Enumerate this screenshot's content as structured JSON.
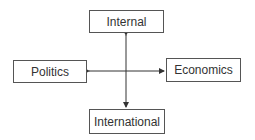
{
  "diagram": {
    "type": "cross-axes",
    "nodes": {
      "top": {
        "label": "Internal"
      },
      "left": {
        "label": "Politics"
      },
      "right": {
        "label": "Economics"
      },
      "bottom": {
        "label": "International"
      }
    },
    "edges": [
      {
        "from": "top",
        "to": "bottom",
        "style": "double-arrow",
        "orientation": "vertical"
      },
      {
        "from": "left",
        "to": "right",
        "style": "double-arrow",
        "orientation": "horizontal"
      }
    ],
    "colors": {
      "line": "#333333",
      "border": "#555555",
      "text": "#333333",
      "background": "#ffffff"
    }
  }
}
